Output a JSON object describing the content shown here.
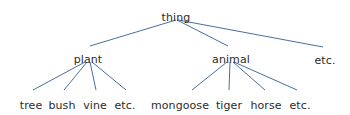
{
  "diagram": {
    "type": "tree",
    "background_color": "#ffffff",
    "edge_color": "#4a6f9e",
    "text_color": "#2b2b2b",
    "width": 350,
    "height": 115,
    "nodes": [
      {
        "id": "thing",
        "label": "thing",
        "level": 0,
        "x": 176,
        "y": 12
      },
      {
        "id": "plant",
        "label": "plant",
        "level": 1,
        "x": 88,
        "y": 54
      },
      {
        "id": "animal",
        "label": "animal",
        "level": 1,
        "x": 231,
        "y": 54
      },
      {
        "id": "etc_top",
        "label": "etc.",
        "level": 1,
        "x": 325,
        "y": 55
      },
      {
        "id": "tree",
        "label": "tree",
        "level": 2,
        "x": 31,
        "y": 100
      },
      {
        "id": "bush",
        "label": "bush",
        "level": 2,
        "x": 62,
        "y": 100
      },
      {
        "id": "vine",
        "label": "vine",
        "level": 2,
        "x": 95,
        "y": 100
      },
      {
        "id": "etc_plant",
        "label": "etc.",
        "level": 2,
        "x": 125,
        "y": 100
      },
      {
        "id": "mongoose",
        "label": "mongoose",
        "level": 2,
        "x": 180,
        "y": 100
      },
      {
        "id": "tiger",
        "label": "tiger",
        "level": 2,
        "x": 229,
        "y": 100
      },
      {
        "id": "horse",
        "label": "horse",
        "level": 2,
        "x": 266,
        "y": 100
      },
      {
        "id": "etc_animal",
        "label": "etc.",
        "level": 2,
        "x": 300,
        "y": 100
      }
    ],
    "edges": [
      {
        "from": "thing",
        "to": "plant",
        "x1": 176,
        "y1": 20,
        "x2": 90,
        "y2": 46
      },
      {
        "from": "thing",
        "to": "animal",
        "x1": 177,
        "y1": 20,
        "x2": 228,
        "y2": 46
      },
      {
        "from": "thing",
        "to": "etc_top",
        "x1": 178,
        "y1": 20,
        "x2": 323,
        "y2": 47
      },
      {
        "from": "plant",
        "to": "tree",
        "x1": 85,
        "y1": 62,
        "x2": 33,
        "y2": 90
      },
      {
        "from": "plant",
        "to": "bush",
        "x1": 87,
        "y1": 62,
        "x2": 64,
        "y2": 90
      },
      {
        "from": "plant",
        "to": "vine",
        "x1": 90,
        "y1": 62,
        "x2": 96,
        "y2": 90
      },
      {
        "from": "plant",
        "to": "etc_plant",
        "x1": 92,
        "y1": 62,
        "x2": 126,
        "y2": 90
      },
      {
        "from": "animal",
        "to": "mongoose",
        "x1": 227,
        "y1": 62,
        "x2": 192,
        "y2": 90
      },
      {
        "from": "animal",
        "to": "tiger",
        "x1": 230,
        "y1": 62,
        "x2": 229,
        "y2": 90
      },
      {
        "from": "animal",
        "to": "horse",
        "x1": 233,
        "y1": 62,
        "x2": 265,
        "y2": 90
      },
      {
        "from": "animal",
        "to": "etc_animal",
        "x1": 234,
        "y1": 62,
        "x2": 297,
        "y2": 90
      }
    ]
  }
}
